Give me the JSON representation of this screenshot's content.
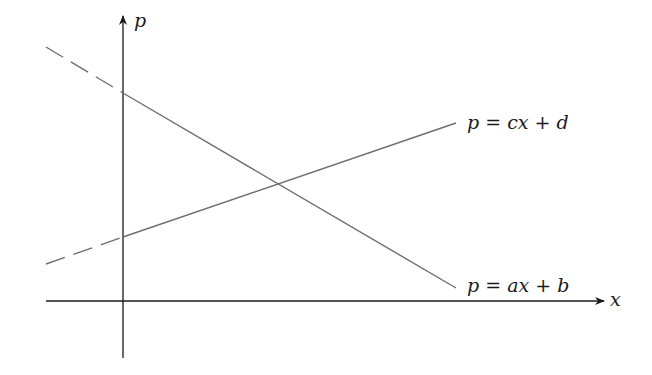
{
  "diagram": {
    "type": "supply-demand-linear-functions",
    "axes": {
      "x_label": "x",
      "y_label": "p"
    },
    "lines": [
      {
        "name": "demand",
        "equation": "p = ax + b",
        "slope_sign": "negative",
        "dashed_segment": "x < 0",
        "color": "#6e6e6e"
      },
      {
        "name": "supply",
        "equation": "p = cx + d",
        "slope_sign": "positive",
        "dashed_segment": "x < 0",
        "color": "#6e6e6e"
      }
    ],
    "colors": {
      "axis": "#1a1a1a",
      "line": "#6e6e6e",
      "background": "#ffffff"
    }
  }
}
